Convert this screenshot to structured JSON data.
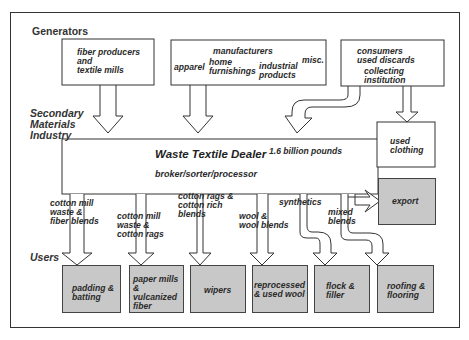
{
  "sections": {
    "generators": "Generators",
    "secondary": [
      "Secondary",
      "Materials",
      "Industry"
    ],
    "users": "Users"
  },
  "generators": {
    "fiber": [
      "fiber producers",
      "and",
      "textile mills"
    ],
    "manufacturers": {
      "title": "manufacturers",
      "apparel": "apparel",
      "home": [
        "home",
        "furnishings"
      ],
      "industrial": [
        "industrial",
        "products"
      ],
      "misc": "misc."
    },
    "consumers": [
      "consumers",
      "used discards"
    ],
    "collecting": [
      "collecting",
      "institution"
    ]
  },
  "used_clothing": [
    "used",
    "clothing"
  ],
  "dealer": {
    "title": "Waste Textile Dealer",
    "subtitle": "broker/sorter/processor",
    "volume": "1.6 billion pounds"
  },
  "export": "export",
  "flows": {
    "cotton_mill_fiber": [
      "cotton mill",
      "waste &",
      "fiber blends"
    ],
    "cotton_mill_rags": [
      "cotton mill",
      "waste &",
      "cotton rags"
    ],
    "cotton_rags_rich": [
      "cotton rags &",
      "cotton rich",
      "blends"
    ],
    "wool": [
      "wool &",
      "wool blends"
    ],
    "synthetics": "synthetics",
    "mixed": [
      "mixed",
      "blends"
    ]
  },
  "users": {
    "padding": [
      "padding &",
      "batting"
    ],
    "paper": [
      "paper mills",
      "&",
      "vulcanized",
      "fiber"
    ],
    "wipers": "wipers",
    "reprocessed": [
      "reprocessed",
      "& used wool"
    ],
    "flock": [
      "flock &",
      "filler"
    ],
    "roofing": [
      "roofing &",
      "flooring"
    ]
  },
  "colors": {
    "shade": "#c8c8c8",
    "line": "#333333"
  }
}
